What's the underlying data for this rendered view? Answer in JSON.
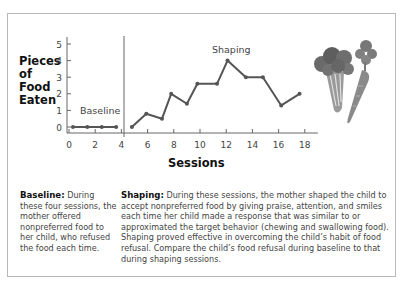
{
  "chart_data": {
    "type": "line",
    "title": "",
    "xlabel": "Sessions",
    "ylabel": "Pieces of Food Eaten",
    "ylabel_lines": [
      "Pieces",
      "of",
      "Food",
      "Eaten"
    ],
    "xlim": [
      0,
      19
    ],
    "ylim": [
      0,
      5
    ],
    "x_ticks": [
      0,
      2,
      4,
      6,
      8,
      10,
      12,
      14,
      16,
      18
    ],
    "y_ticks": [
      0,
      1,
      2,
      3,
      4,
      5
    ],
    "grid": false,
    "phase_change_x": 4.2,
    "series": [
      {
        "name": "Baseline",
        "x": [
          0.3,
          1.4,
          2.5,
          3.6
        ],
        "values": [
          0,
          0,
          0,
          0
        ]
      },
      {
        "name": "Shaping",
        "x": [
          4.8,
          5.9,
          7.1,
          7.8,
          9.0,
          9.8,
          11.3,
          12.1,
          13.5,
          14.8,
          16.2,
          17.6
        ],
        "values": [
          0,
          0.8,
          0.5,
          2.0,
          1.4,
          2.6,
          2.6,
          4.0,
          3.0,
          3.0,
          1.3,
          2.0
        ]
      }
    ],
    "annotations": [
      "Baseline",
      "Shaping"
    ]
  },
  "captions": {
    "baseline": {
      "heading": "Baseline:",
      "text": " During these four sessions, the mother offered nonpreferred food to her child, who refused the food each time."
    },
    "shaping": {
      "heading": "Shaping:",
      "text": " During these sessions, the mother shaped the child to accept nonpreferred food by giving praise, attention, and smiles each time her child made a response that was similar to or approximated the target behavior (chewing and swallowing food). Shaping proved effective in overcoming the child’s habit of food refusal. Compare the child’s food refusal during baseline to that during shaping sessions."
    }
  },
  "illustration": "broccoli-and-carrot",
  "colors": {
    "line": "#555555",
    "axis": "#666666",
    "frame": "#b8b8b8"
  }
}
